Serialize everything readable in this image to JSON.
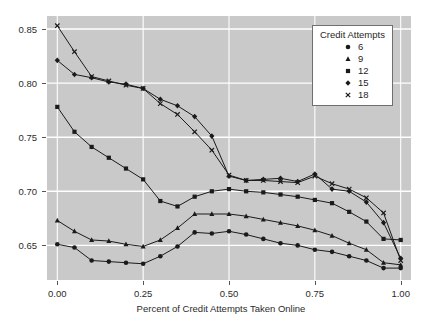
{
  "chart_data": {
    "type": "line",
    "title": "",
    "xlabel": "Percent of Credit Attempts Taken Online",
    "ylabel": "",
    "xlim": [
      -0.03,
      1.03
    ],
    "ylim": [
      0.618,
      0.862
    ],
    "xticks": [
      "0.00",
      "0.25",
      "0.50",
      "0.75",
      "1.00"
    ],
    "xtick_values": [
      0,
      0.25,
      0.5,
      0.75,
      1.0
    ],
    "yticks": [
      "0.85",
      "0.80",
      "0.75",
      "0.70",
      "0.65"
    ],
    "ytick_values": [
      0.85,
      0.8,
      0.75,
      0.7,
      0.65
    ],
    "grid": true,
    "grid_color": "#ffffff",
    "panel_background": "#c9c9c9",
    "legend_position": "top-right",
    "legend_title": "Credit Attempts",
    "x": [
      0.0,
      0.05,
      0.1,
      0.15,
      0.2,
      0.25,
      0.3,
      0.35,
      0.4,
      0.45,
      0.5,
      0.55,
      0.6,
      0.65,
      0.7,
      0.75,
      0.8,
      0.85,
      0.9,
      0.95,
      1.0
    ],
    "series": [
      {
        "name": "6",
        "marker": "circle",
        "color": "#1a1a1a",
        "values": [
          0.651,
          0.648,
          0.636,
          0.635,
          0.634,
          0.633,
          0.64,
          0.649,
          0.662,
          0.661,
          0.663,
          0.66,
          0.656,
          0.652,
          0.65,
          0.646,
          0.644,
          0.64,
          0.636,
          0.629,
          0.629
        ]
      },
      {
        "name": "9",
        "marker": "triangle",
        "color": "#1a1a1a",
        "values": [
          0.673,
          0.663,
          0.655,
          0.654,
          0.651,
          0.649,
          0.655,
          0.666,
          0.679,
          0.679,
          0.679,
          0.677,
          0.674,
          0.671,
          0.668,
          0.664,
          0.659,
          0.652,
          0.646,
          0.634,
          0.632
        ]
      },
      {
        "name": "12",
        "marker": "square",
        "color": "#1a1a1a",
        "values": [
          0.778,
          0.755,
          0.741,
          0.731,
          0.721,
          0.711,
          0.691,
          0.686,
          0.695,
          0.7,
          0.702,
          0.7,
          0.699,
          0.697,
          0.695,
          0.692,
          0.689,
          0.681,
          0.672,
          0.656,
          0.655
        ]
      },
      {
        "name": "15",
        "marker": "diamond",
        "color": "#1a1a1a",
        "values": [
          0.821,
          0.808,
          0.805,
          0.801,
          0.799,
          0.795,
          0.785,
          0.779,
          0.769,
          0.751,
          0.714,
          0.71,
          0.711,
          0.712,
          0.709,
          0.716,
          0.702,
          0.7,
          0.69,
          0.671,
          0.638
        ]
      },
      {
        "name": "18",
        "marker": "cross",
        "color": "#1a1a1a",
        "values": [
          0.853,
          0.829,
          0.806,
          0.802,
          0.798,
          0.795,
          0.781,
          0.771,
          0.755,
          0.738,
          0.715,
          0.71,
          0.71,
          0.709,
          0.708,
          0.714,
          0.707,
          0.702,
          0.694,
          0.68,
          0.636
        ]
      }
    ]
  },
  "legend": {
    "title": "Credit Attempts",
    "items": [
      {
        "label": "6",
        "marker": "circle"
      },
      {
        "label": "9",
        "marker": "triangle"
      },
      {
        "label": "12",
        "marker": "square"
      },
      {
        "label": "15",
        "marker": "diamond"
      },
      {
        "label": "18",
        "marker": "cross"
      }
    ]
  },
  "axes": {
    "x_title": "Percent of Credit Attempts Taken Online"
  }
}
